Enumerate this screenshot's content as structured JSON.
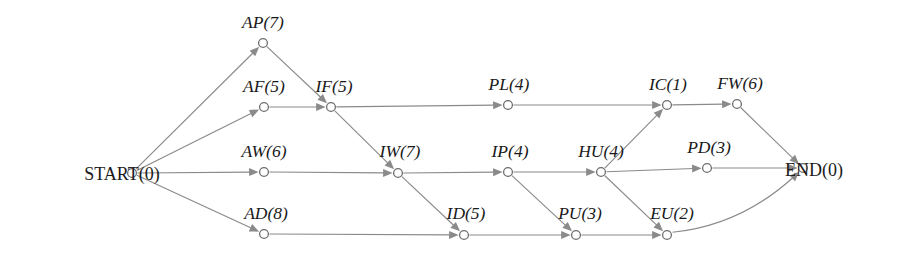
{
  "diagram": {
    "type": "activity-on-node-network",
    "colors": {
      "edge": "#8a8a8a",
      "node_stroke": "#6d6d6d",
      "node_fill": "#ffffff",
      "label_text": "#1a1a1a",
      "background": "#ffffff"
    },
    "nodes": [
      {
        "id": "START",
        "label": "START(0)",
        "code": "START",
        "duration": 0,
        "x": 132,
        "y": 173,
        "label_x": 122,
        "label_y": 180,
        "anchor": "end",
        "style": "roman"
      },
      {
        "id": "AP",
        "label": "AP(7)",
        "code": "AP",
        "duration": 7,
        "x": 263,
        "y": 43,
        "label_x": 263,
        "label_y": 28,
        "anchor": "middle",
        "style": "italic"
      },
      {
        "id": "AF",
        "label": "AF(5)",
        "code": "AF",
        "duration": 5,
        "x": 264,
        "y": 107,
        "label_x": 264,
        "label_y": 92,
        "anchor": "middle",
        "style": "italic"
      },
      {
        "id": "AW",
        "label": "AW(6)",
        "code": "AW",
        "duration": 6,
        "x": 264,
        "y": 172,
        "label_x": 264,
        "label_y": 157,
        "anchor": "middle",
        "style": "italic"
      },
      {
        "id": "AD",
        "label": "AD(8)",
        "code": "AD",
        "duration": 8,
        "x": 264,
        "y": 234,
        "label_x": 266,
        "label_y": 219,
        "anchor": "middle",
        "style": "italic"
      },
      {
        "id": "IF",
        "label": "IF(5)",
        "code": "IF",
        "duration": 5,
        "x": 331,
        "y": 107,
        "label_x": 334,
        "label_y": 92,
        "anchor": "middle",
        "style": "italic"
      },
      {
        "id": "IW",
        "label": "IW(7)",
        "code": "IW",
        "duration": 7,
        "x": 398,
        "y": 173,
        "label_x": 400,
        "label_y": 157,
        "anchor": "middle",
        "style": "italic"
      },
      {
        "id": "ID",
        "label": "ID(5)",
        "code": "ID",
        "duration": 5,
        "x": 464,
        "y": 235,
        "label_x": 466,
        "label_y": 219,
        "anchor": "middle",
        "style": "italic"
      },
      {
        "id": "PL",
        "label": "PL(4)",
        "code": "PL",
        "duration": 4,
        "x": 508,
        "y": 105,
        "label_x": 509,
        "label_y": 90,
        "anchor": "middle",
        "style": "italic"
      },
      {
        "id": "IP",
        "label": "IP(4)",
        "code": "IP",
        "duration": 4,
        "x": 508,
        "y": 172,
        "label_x": 510,
        "label_y": 157,
        "anchor": "middle",
        "style": "italic"
      },
      {
        "id": "PU",
        "label": "PU(3)",
        "code": "PU",
        "duration": 3,
        "x": 576,
        "y": 235,
        "label_x": 580,
        "label_y": 219,
        "anchor": "middle",
        "style": "italic"
      },
      {
        "id": "HU",
        "label": "HU(4)",
        "code": "HU",
        "duration": 4,
        "x": 601,
        "y": 172,
        "label_x": 601,
        "label_y": 157,
        "anchor": "middle",
        "style": "italic"
      },
      {
        "id": "EU",
        "label": "EU(2)",
        "code": "EU",
        "duration": 2,
        "x": 667,
        "y": 235,
        "label_x": 672,
        "label_y": 219,
        "anchor": "middle",
        "style": "italic"
      },
      {
        "id": "IC",
        "label": "IC(1)",
        "code": "IC",
        "duration": 1,
        "x": 667,
        "y": 105,
        "label_x": 668,
        "label_y": 90,
        "anchor": "middle",
        "style": "italic"
      },
      {
        "id": "PD",
        "label": "PD(3)",
        "code": "PD",
        "duration": 3,
        "x": 707,
        "y": 168,
        "label_x": 709,
        "label_y": 153,
        "anchor": "middle",
        "style": "italic"
      },
      {
        "id": "FW",
        "label": "FW(6)",
        "code": "FW",
        "duration": 6,
        "x": 737,
        "y": 104,
        "label_x": 740,
        "label_y": 89,
        "anchor": "middle",
        "style": "italic"
      },
      {
        "id": "END",
        "label": "END(0)",
        "code": "END",
        "duration": 0,
        "x": 803,
        "y": 168,
        "label_x": 814,
        "label_y": 176,
        "anchor": "start",
        "style": "roman"
      }
    ],
    "edges": [
      {
        "from": "START",
        "to": "AP",
        "curved": false
      },
      {
        "from": "START",
        "to": "AF",
        "curved": false
      },
      {
        "from": "START",
        "to": "AW",
        "curved": false
      },
      {
        "from": "START",
        "to": "AD",
        "curved": false
      },
      {
        "from": "AP",
        "to": "IF",
        "curved": false
      },
      {
        "from": "AF",
        "to": "IF",
        "curved": false
      },
      {
        "from": "AW",
        "to": "IW",
        "curved": false
      },
      {
        "from": "AD",
        "to": "ID",
        "curved": false
      },
      {
        "from": "IF",
        "to": "PL",
        "curved": false
      },
      {
        "from": "IF",
        "to": "IW",
        "curved": false
      },
      {
        "from": "IW",
        "to": "IP",
        "curved": false
      },
      {
        "from": "IW",
        "to": "ID",
        "curved": false
      },
      {
        "from": "ID",
        "to": "PU",
        "curved": false
      },
      {
        "from": "PL",
        "to": "IC",
        "curved": false
      },
      {
        "from": "IP",
        "to": "HU",
        "curved": false
      },
      {
        "from": "IP",
        "to": "PU",
        "curved": false
      },
      {
        "from": "PU",
        "to": "EU",
        "curved": false
      },
      {
        "from": "HU",
        "to": "IC",
        "curved": false
      },
      {
        "from": "HU",
        "to": "PD",
        "curved": false
      },
      {
        "from": "HU",
        "to": "EU",
        "curved": false
      },
      {
        "from": "IC",
        "to": "FW",
        "curved": false
      },
      {
        "from": "FW",
        "to": "END",
        "curved": false
      },
      {
        "from": "PD",
        "to": "END",
        "curved": false
      },
      {
        "from": "EU",
        "to": "END",
        "curved": true,
        "sweep": 1,
        "bow": 26
      }
    ]
  }
}
